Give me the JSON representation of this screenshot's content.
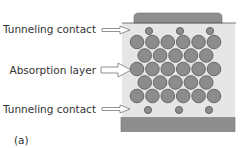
{
  "diagram": {
    "panel_label": "(a)",
    "labels": {
      "top": "Tunneling contact",
      "middle": "Absorption layer",
      "bottom": "Tunneling contact"
    },
    "colors": {
      "panel_bg": "#e6e6e6",
      "pad": "#8e8e8e",
      "pad_stroke": "#6e6e6e",
      "dot_fill": "#8c8c8c",
      "dot_stroke": "#555555",
      "arrow_stroke": "#777777",
      "text": "#333333"
    },
    "layers": [
      {
        "name": "top-electrode",
        "type": "pad"
      },
      {
        "name": "top-tunneling-contact",
        "type": "small-dots",
        "count": 3
      },
      {
        "name": "absorption-layer",
        "type": "dot-array",
        "rows": [
          6,
          5,
          6,
          5,
          6
        ]
      },
      {
        "name": "bottom-tunneling-contact",
        "type": "small-dots",
        "count": 3
      },
      {
        "name": "bottom-electrode",
        "type": "pad"
      }
    ]
  }
}
